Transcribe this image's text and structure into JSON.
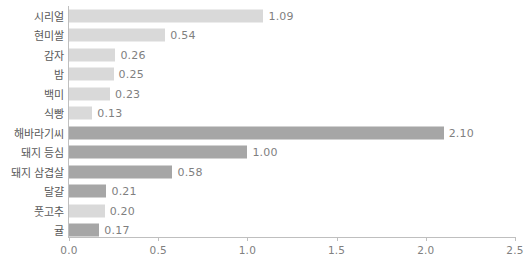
{
  "chart_data": {
    "type": "bar",
    "orientation": "horizontal",
    "title": "",
    "subtitle": "",
    "xlabel": "",
    "ylabel": "",
    "xlim": [
      0.0,
      2.5
    ],
    "grid": false,
    "legend": null,
    "xticks": [
      "0.0",
      "0.5",
      "1.0",
      "1.5",
      "2.0",
      "2.5"
    ],
    "xtick_values": [
      0.0,
      0.5,
      1.0,
      1.5,
      2.0,
      2.5
    ],
    "colors": {
      "light_bar": "#d9d9d9",
      "dark_bar": "#a6a6a6",
      "axis": "#bfbfbf",
      "category_text": "#595959",
      "value_text": "#7f7f7f",
      "tick_text": "#808080"
    },
    "categories": [
      "시리얼",
      "현미쌀",
      "감자",
      "밤",
      "백미",
      "식빵",
      "해바라기씨",
      "돼지 등심",
      "돼지 삼겹살",
      "달걀",
      "풋고추",
      "귤"
    ],
    "values": [
      1.09,
      0.54,
      0.26,
      0.25,
      0.23,
      0.13,
      2.1,
      1.0,
      0.58,
      0.21,
      0.2,
      0.17
    ],
    "value_labels": [
      "1.09",
      "0.54",
      "0.26",
      "0.25",
      "0.23",
      "0.13",
      "2.10",
      "1.00",
      "0.58",
      "0.21",
      "0.20",
      "0.17"
    ],
    "bar_shades": [
      "light",
      "light",
      "light",
      "light",
      "light",
      "light",
      "dark",
      "dark",
      "dark",
      "dark",
      "light",
      "dark"
    ],
    "bars": [
      {
        "category": "시리얼",
        "value": 1.09,
        "label": "1.09",
        "shade": "light"
      },
      {
        "category": "현미쌀",
        "value": 0.54,
        "label": "0.54",
        "shade": "light"
      },
      {
        "category": "감자",
        "value": 0.26,
        "label": "0.26",
        "shade": "light"
      },
      {
        "category": "밤",
        "value": 0.25,
        "label": "0.25",
        "shade": "light"
      },
      {
        "category": "백미",
        "value": 0.23,
        "label": "0.23",
        "shade": "light"
      },
      {
        "category": "식빵",
        "value": 0.13,
        "label": "0.13",
        "shade": "light"
      },
      {
        "category": "해바라기씨",
        "value": 2.1,
        "label": "2.10",
        "shade": "dark"
      },
      {
        "category": "돼지 등심",
        "value": 1.0,
        "label": "1.00",
        "shade": "dark"
      },
      {
        "category": "돼지 삼겹살",
        "value": 0.58,
        "label": "0.58",
        "shade": "dark"
      },
      {
        "category": "달걀",
        "value": 0.21,
        "label": "0.21",
        "shade": "dark"
      },
      {
        "category": "풋고추",
        "value": 0.2,
        "label": "0.20",
        "shade": "light"
      },
      {
        "category": "귤",
        "value": 0.17,
        "label": "0.17",
        "shade": "dark"
      }
    ]
  }
}
